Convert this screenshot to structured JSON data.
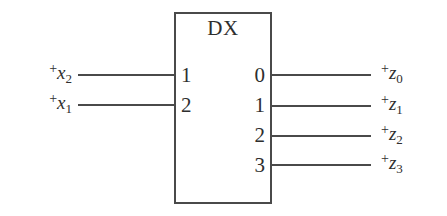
{
  "diagram": {
    "kind": "logic-block-diagram",
    "block": {
      "title": "DX",
      "description": "demultiplexer block",
      "inputs": [
        {
          "port": "1",
          "signal_plus": "+",
          "signal_var": "x",
          "signal_sub": "2"
        },
        {
          "port": "2",
          "signal_plus": "+",
          "signal_var": "x",
          "signal_sub": "1"
        }
      ],
      "outputs": [
        {
          "port": "0",
          "signal_plus": "+",
          "signal_var": "z",
          "signal_sub": "0"
        },
        {
          "port": "1",
          "signal_plus": "+",
          "signal_var": "z",
          "signal_sub": "1"
        },
        {
          "port": "2",
          "signal_plus": "+",
          "signal_var": "z",
          "signal_sub": "2"
        },
        {
          "port": "3",
          "signal_plus": "+",
          "signal_var": "z",
          "signal_sub": "3"
        }
      ]
    },
    "colors": {
      "line": "#4a4a4a",
      "text": "#2e2e2e",
      "background": "#ffffff"
    }
  }
}
